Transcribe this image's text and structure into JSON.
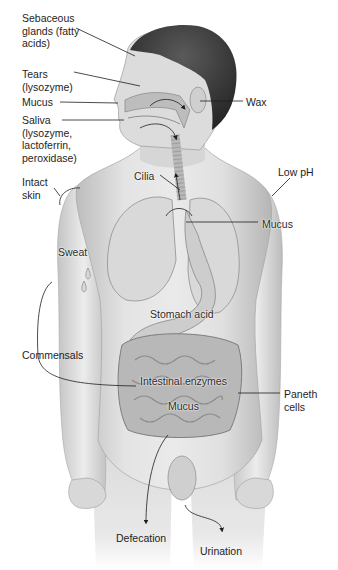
{
  "figure": {
    "colors": {
      "skin_light": "#e6e6e6",
      "skin_mid": "#c9c9c9",
      "skin_dark": "#9a9a9a",
      "hair": "#3a3a3a",
      "line": "#1e1e1e",
      "organ": "#d4d4d4",
      "gut": "#b9b9b9"
    }
  },
  "labels": [
    {
      "id": "sebaceous",
      "text": "Sebaceous\nglands (fatty\nacids)",
      "x": 22,
      "y": 12
    },
    {
      "id": "tears",
      "text": "Tears\n(lysozyme)",
      "x": 22,
      "y": 68
    },
    {
      "id": "mucus-nose",
      "text": "Mucus",
      "x": 22,
      "y": 96
    },
    {
      "id": "saliva",
      "text": "Saliva\n(lysozyme,\nlactoferrin,\nperoxidase)",
      "x": 22,
      "y": 114
    },
    {
      "id": "wax",
      "text": "Wax",
      "x": 246,
      "y": 96
    },
    {
      "id": "intact-skin",
      "text": "Intact\nskin",
      "x": 22,
      "y": 176
    },
    {
      "id": "cilia",
      "text": "Cilia",
      "x": 134,
      "y": 170
    },
    {
      "id": "low-ph",
      "text": "Low pH",
      "x": 278,
      "y": 166
    },
    {
      "id": "mucus-lung",
      "text": "Mucus",
      "x": 262,
      "y": 218
    },
    {
      "id": "sweat",
      "text": "Sweat",
      "x": 58,
      "y": 246
    },
    {
      "id": "stomach-acid",
      "text": "Stomach acid",
      "x": 150,
      "y": 308
    },
    {
      "id": "commensals",
      "text": "Commensals",
      "x": 22,
      "y": 349
    },
    {
      "id": "intestinal-enzymes",
      "text": "Intestinal enzymes",
      "x": 140,
      "y": 375
    },
    {
      "id": "mucus-gut",
      "text": "Mucus",
      "x": 168,
      "y": 400
    },
    {
      "id": "paneth-cells",
      "text": "Paneth\ncells",
      "x": 284,
      "y": 388
    },
    {
      "id": "defecation",
      "text": "Defecation",
      "x": 116,
      "y": 532
    },
    {
      "id": "urination",
      "text": "Urination",
      "x": 200,
      "y": 545
    }
  ]
}
